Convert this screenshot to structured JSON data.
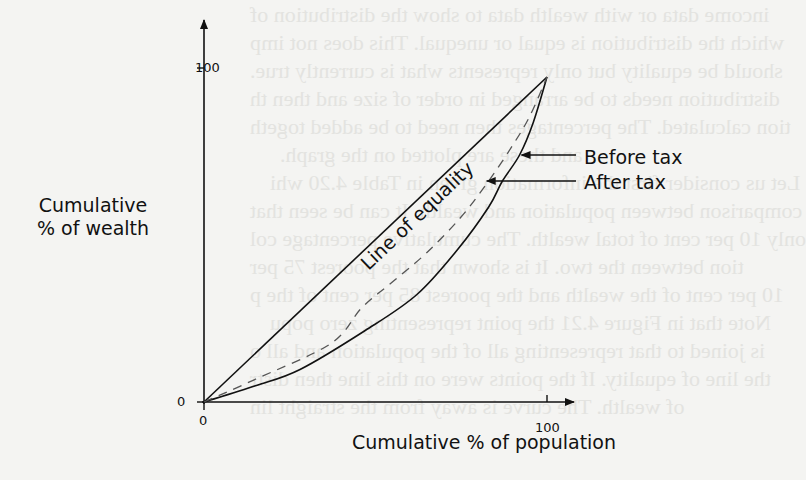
{
  "figure": {
    "type": "lorenz-curve",
    "y_axis": {
      "title_line1": "Cumulative",
      "title_line2": "% of wealth",
      "ticks": [
        "0",
        "100"
      ]
    },
    "x_axis": {
      "title": "Cumulative % of population",
      "ticks": [
        "0",
        "100"
      ]
    },
    "equality_label": "Line of equality",
    "legend": {
      "before_tax": "Before tax",
      "after_tax": "After tax"
    }
  },
  "chart_data": {
    "type": "line",
    "title": "",
    "xlabel": "Cumulative % of population",
    "ylabel": "Cumulative % of wealth",
    "xlim": [
      0,
      100
    ],
    "ylim": [
      0,
      100
    ],
    "x_ticks": [
      0,
      100
    ],
    "y_ticks": [
      0,
      100
    ],
    "grid": false,
    "series": [
      {
        "name": "Line of equality",
        "style": "solid",
        "x": [
          0,
          100
        ],
        "y": [
          0,
          100
        ]
      },
      {
        "name": "Before tax",
        "style": "solid",
        "x": [
          0,
          15,
          28,
          47,
          62,
          74,
          83,
          87,
          92,
          96,
          100
        ],
        "y": [
          0,
          5,
          10,
          22,
          33,
          47,
          60,
          68,
          76,
          86,
          100
        ]
      },
      {
        "name": "After tax",
        "style": "dashed",
        "x": [
          0,
          15,
          37,
          46,
          55,
          65,
          75,
          83,
          90,
          95,
          100
        ],
        "y": [
          0,
          7,
          18,
          29,
          37,
          46,
          57,
          68,
          79,
          88,
          100
        ]
      }
    ],
    "annotations": [
      {
        "text": "Before tax",
        "points_to": "Before tax",
        "at": [
          92,
          76
        ]
      },
      {
        "text": "After tax",
        "points_to": "After tax",
        "at": [
          83,
          68
        ]
      },
      {
        "text": "Line of equality",
        "along": "Line of equality"
      }
    ]
  },
  "background_bleed_text": [
    "income data or with wealth data to show the distribution of",
    "which the distribution is equal or unequal. This does not imp",
    "should be equality but only represents what is currently true.",
    "distribution needs to be arranged in order of size and then th",
    "tion calculated. The percentages then need to be added togeth",
    "and these are plotted on the graph.",
    "Let us consider first the information given in Table 4.20 whi",
    "comparison between population and wealth. It can be seen that",
    "only 10 per cent of total wealth. The cumulative percentage col",
    "tion between the two. It is shown that the poorest 75 per",
    "10 per cent of the wealth and the poorest 85 per cent of the p",
    "Note that in Figure 4.21 the point representing zero popu",
    "is joined to that representing all of the population and all o",
    "the line of equality. If the points were on this line then distr",
    "of wealth. The curve is away from the straight lin"
  ]
}
